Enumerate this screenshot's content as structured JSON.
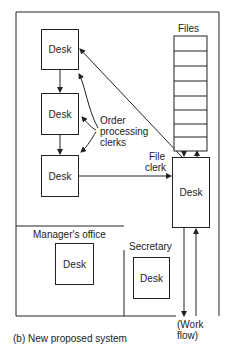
{
  "diagram": {
    "caption": "(b) New proposed system",
    "desks": {
      "desk1": "Desk",
      "desk2": "Desk",
      "desk3": "Desk",
      "file_clerk_desk": "Desk",
      "manager_desk": "Desk",
      "secretary_desk": "Desk"
    },
    "labels": {
      "files": "Files",
      "order_line1": "Order",
      "order_line2": "processing",
      "order_line3": "clerks",
      "file_clerk_line1": "File",
      "file_clerk_line2": "clerk",
      "manager_office": "Manager's office",
      "secretary": "Secretary",
      "work_flow_line1": "(Work",
      "work_flow_line2": "flow)"
    },
    "files_drawer_count": 6,
    "line_color": "#222222",
    "background": "#ffffff"
  }
}
